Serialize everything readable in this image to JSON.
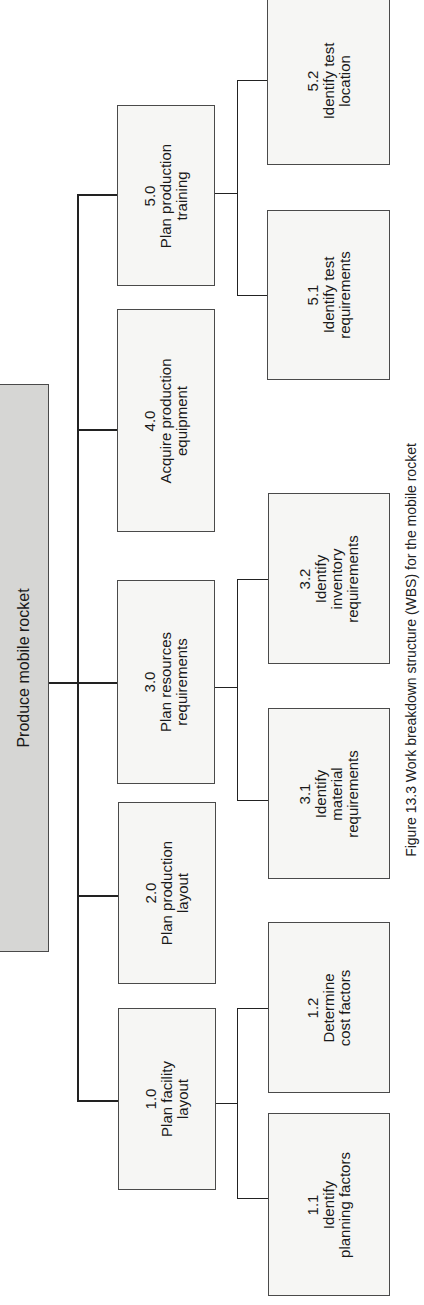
{
  "diagram": {
    "type": "work-breakdown-structure",
    "orientation": "rotated-90-ccw",
    "root": {
      "label": "Produce mobile rocket",
      "fill": "#d6d6d4"
    },
    "level1": [
      {
        "id": "1.0",
        "lines": [
          "1.0",
          "Plan facility",
          "layout"
        ]
      },
      {
        "id": "2.0",
        "lines": [
          "2.0",
          "Plan production",
          "layout"
        ]
      },
      {
        "id": "3.0",
        "lines": [
          "3.0",
          "Plan resources",
          "requirements"
        ]
      },
      {
        "id": "4.0",
        "lines": [
          "4.0",
          "Acquire production",
          "equipment"
        ]
      },
      {
        "id": "5.0",
        "lines": [
          "5.0",
          "Plan production",
          "training"
        ]
      }
    ],
    "level2": [
      {
        "id": "1.1",
        "parent": "1.0",
        "lines": [
          "1.1",
          "Identify",
          "planning factors"
        ]
      },
      {
        "id": "1.2",
        "parent": "1.0",
        "lines": [
          "1.2",
          "Determine",
          "cost factors"
        ]
      },
      {
        "id": "3.1",
        "parent": "3.0",
        "lines": [
          "3.1",
          "Identify",
          "material",
          "requirements"
        ]
      },
      {
        "id": "3.2",
        "parent": "3.0",
        "lines": [
          "3.2",
          "Identify",
          "inventory",
          "requirements"
        ]
      },
      {
        "id": "5.1",
        "parent": "5.0",
        "lines": [
          "5.1",
          "Identify test",
          "requirements"
        ]
      },
      {
        "id": "5.2",
        "parent": "5.0",
        "lines": [
          "5.2",
          "Identify test",
          "location"
        ]
      }
    ],
    "caption": "Figure 13.3  Work breakdown structure (WBS) for the mobile rocket"
  }
}
